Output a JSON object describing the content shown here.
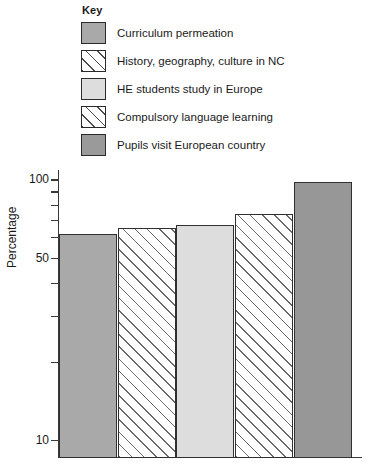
{
  "legend": {
    "title": "Key",
    "items": [
      {
        "label": "Curriculum permeation",
        "swatch": "solid-mid",
        "swatch_name": "legend-swatch-solid-gray"
      },
      {
        "label": "History, geography, culture in NC",
        "swatch": "hatch",
        "swatch_name": "legend-swatch-diagonal-hatch"
      },
      {
        "label": "HE students study in Europe",
        "swatch": "solid-light",
        "swatch_name": "legend-swatch-light-gray"
      },
      {
        "label": "Compulsory language learning",
        "swatch": "hatch",
        "swatch_name": "legend-swatch-diagonal-hatch"
      },
      {
        "label": "Pupils visit European country",
        "swatch": "solid-dark",
        "swatch_name": "legend-swatch-dark-gray"
      }
    ]
  },
  "axis": {
    "ylabel": "Percentage",
    "tick_labels": [
      "100",
      "50",
      "10"
    ],
    "minor_ticks": [
      "90",
      "80",
      "70",
      "60",
      "40",
      "30",
      "20"
    ]
  },
  "colors": {
    "solid_mid": "#a9a9a9",
    "solid_light": "#dddddd",
    "solid_dark": "#979797",
    "hatch_bg": "#ffffff",
    "hatch_line": "#6a6a6a",
    "outline": "#303030",
    "axis": "#3a3a3a",
    "text": "#1a1a1a"
  },
  "chart_data": {
    "type": "bar",
    "title": "",
    "xlabel": "",
    "ylabel": "Percentage",
    "yscale": "log",
    "ylim": [
      10,
      100
    ],
    "yticks": [
      100,
      50,
      10
    ],
    "ytick_labels": [
      "100",
      "50",
      "10"
    ],
    "grid": false,
    "legend_position": "top-left",
    "categories": [
      "Curriculum permeation",
      "History, geography, culture in NC",
      "HE students study in Europe",
      "Compulsory language learning",
      "Pupils visit European country"
    ],
    "values": [
      62,
      65,
      67,
      74,
      98
    ],
    "bar_styles": [
      "solid-mid",
      "hatch",
      "solid-light",
      "hatch",
      "solid-dark"
    ]
  }
}
